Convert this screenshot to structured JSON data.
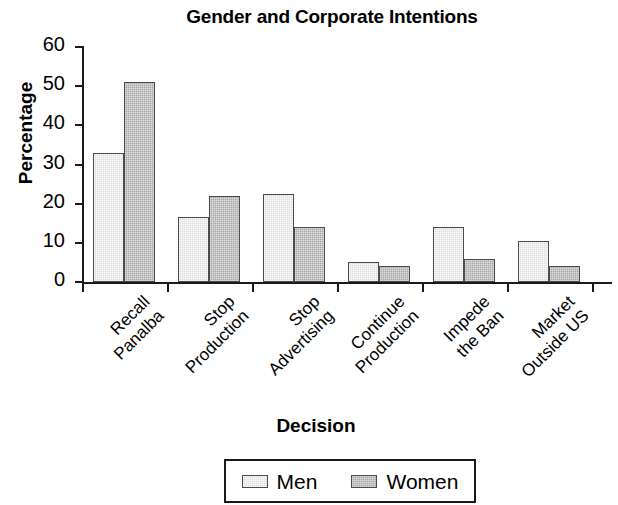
{
  "chart_data": {
    "type": "bar",
    "title": "Gender and Corporate Intentions",
    "xlabel": "Decision",
    "ylabel": "Percentage",
    "categories": [
      "Recall\nPanalba",
      "Stop\nProduction",
      "Stop\nAdvertising",
      "Continue\nProduction",
      "Impede\nthe Ban",
      "Market\nOutside US"
    ],
    "series": [
      {
        "name": "Men",
        "values": [
          33,
          16.5,
          22.5,
          5,
          14,
          10.5
        ],
        "color": "#dcdcdc"
      },
      {
        "name": "Women",
        "values": [
          51,
          22,
          14,
          4,
          6,
          4
        ],
        "color": "#a8a8a8"
      }
    ],
    "ylim": [
      0,
      60
    ],
    "ytick_labels": [
      "60",
      "50",
      "40",
      "30",
      "20",
      "10",
      "0"
    ],
    "ytick_values": [
      60,
      50,
      40,
      30,
      20,
      10,
      0
    ],
    "grid": false,
    "legend_position": "bottom-center"
  },
  "legend": {
    "items": [
      {
        "label": "Men"
      },
      {
        "label": "Women"
      }
    ]
  }
}
